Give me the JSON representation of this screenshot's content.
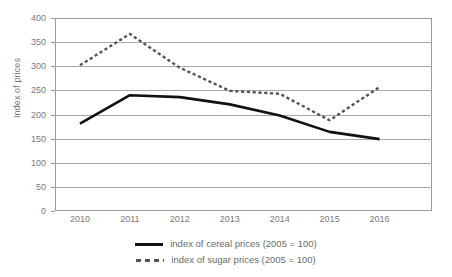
{
  "chart_data": {
    "type": "line",
    "title": "",
    "xlabel": "",
    "ylabel": "Index of prices",
    "categories": [
      "2010",
      "2011",
      "2012",
      "2013",
      "2014",
      "2015",
      "2016"
    ],
    "x": [
      2010,
      2011,
      2012,
      2013,
      2014,
      2015,
      2016
    ],
    "ylim": [
      0,
      400
    ],
    "yticks": [
      0,
      50,
      100,
      150,
      200,
      250,
      300,
      350,
      400
    ],
    "grid": "horizontal",
    "legend_position": "bottom",
    "series": [
      {
        "name": "index of cereal prices (2005 = 100)",
        "style": "solid",
        "color": "#111111",
        "values": [
          181,
          240,
          236,
          221,
          198,
          164,
          149
        ]
      },
      {
        "name": "index of sugar prices (2005 = 100)",
        "style": "dotted",
        "color": "#555555",
        "values": [
          302,
          367,
          297,
          249,
          243,
          188,
          257
        ]
      }
    ]
  },
  "axis": {
    "y_title": "Index of prices",
    "y_tick_labels": [
      "400",
      "350",
      "300",
      "250",
      "200",
      "150",
      "100",
      "50",
      "0"
    ],
    "x_tick_labels": [
      "2010",
      "2011",
      "2012",
      "2013",
      "2014",
      "2015",
      "2016"
    ]
  },
  "legend": {
    "items": [
      {
        "label": "index of cereal prices (2005 = 100)",
        "marker": "solid-line-marker"
      },
      {
        "label": "index of sugar prices (2005 = 100)",
        "marker": "dotted-line-marker"
      }
    ]
  },
  "colors": {
    "cereal_line": "#111111",
    "sugar_line": "#555555",
    "gridline": "#a8a8a8",
    "axis": "#9a9a9a",
    "text": "#6b6b6b",
    "background": "#ffffff"
  }
}
